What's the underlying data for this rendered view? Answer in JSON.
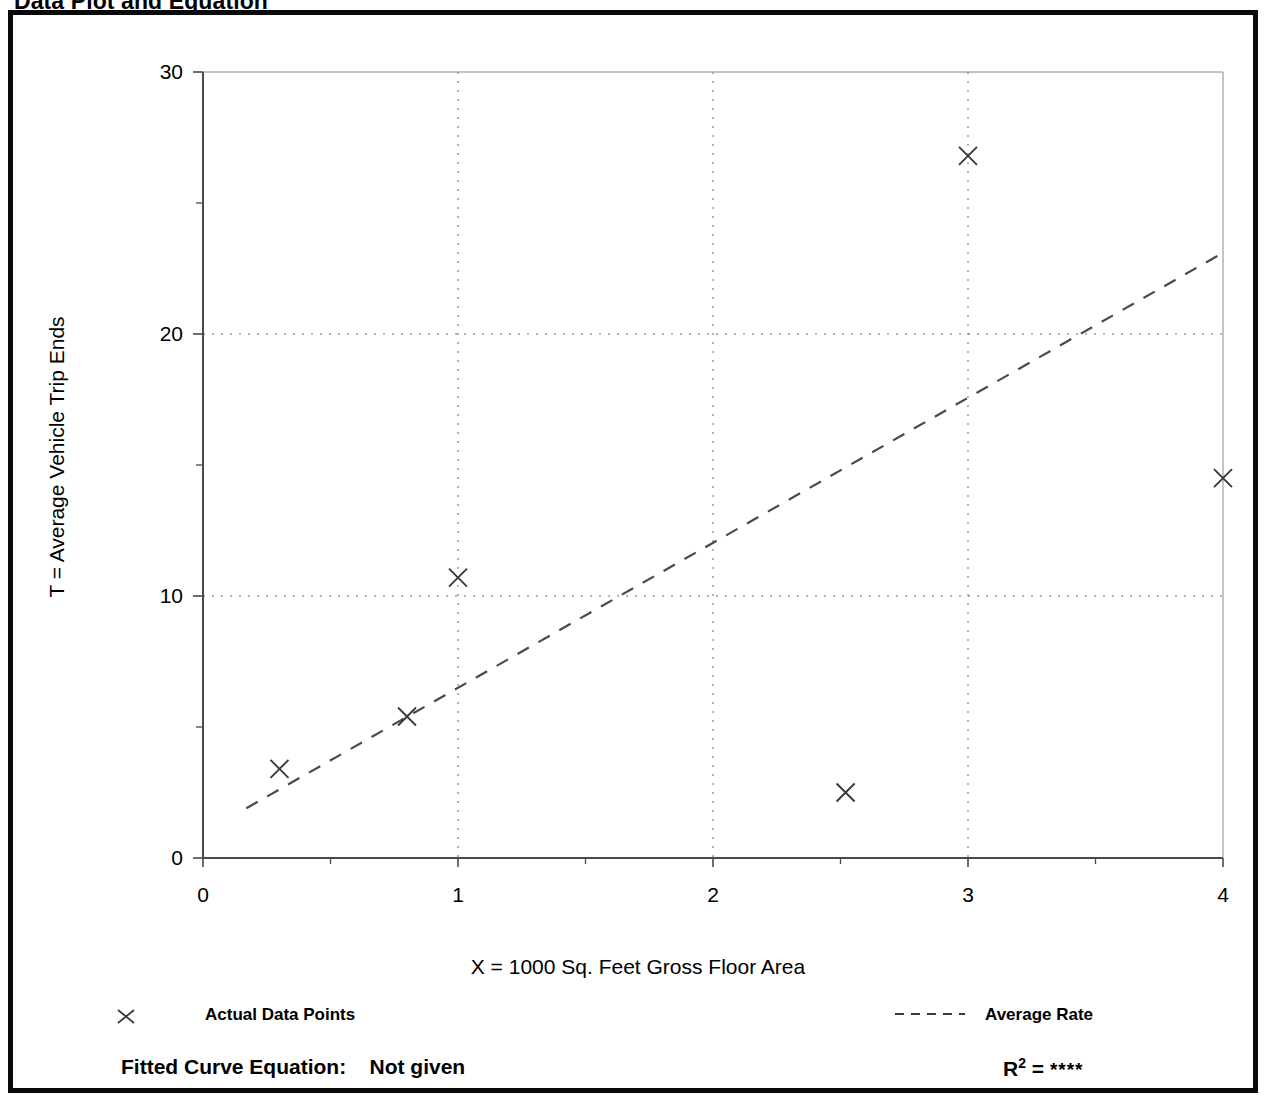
{
  "page": {
    "title": "Data Plot and Equation"
  },
  "chart_data": {
    "type": "scatter",
    "title": "Data Plot and Equation",
    "xlabel": "X = 1000 Sq. Feet Gross Floor Area",
    "ylabel": "T = Average Vehicle Trip Ends",
    "xlim": [
      0,
      4
    ],
    "ylim": [
      0,
      30
    ],
    "xticks": [
      0,
      1,
      2,
      3,
      4
    ],
    "xtick_labels": [
      "0",
      "1",
      "2",
      "3",
      "4"
    ],
    "xminor_ticks": [
      0.5,
      1.5,
      2.5,
      3.5
    ],
    "yticks": [
      0,
      10,
      20,
      30
    ],
    "ytick_labels": [
      "0",
      "10",
      "20",
      "30"
    ],
    "yminor_ticks": [
      5,
      15,
      25
    ],
    "grid": true,
    "gridlines_x": [
      1,
      2,
      3
    ],
    "gridlines_y": [
      10,
      20
    ],
    "legend_position": "below-axes",
    "series": [
      {
        "name": "Actual Data Points",
        "type": "scatter",
        "marker": "x",
        "points": [
          {
            "x": 0.3,
            "y": 3.4
          },
          {
            "x": 0.8,
            "y": 5.4
          },
          {
            "x": 1.0,
            "y": 10.7
          },
          {
            "x": 2.52,
            "y": 2.5
          },
          {
            "x": 3.0,
            "y": 26.8
          },
          {
            "x": 4.0,
            "y": 14.5
          }
        ]
      },
      {
        "name": "Average Rate",
        "type": "line",
        "style": "dashed",
        "points": [
          {
            "x": 0.17,
            "y": 1.9
          },
          {
            "x": 4.0,
            "y": 23.1
          }
        ]
      }
    ]
  },
  "legend": {
    "points_marker": "x-marker-icon",
    "points_label": "Actual Data Points",
    "rate_swatch": "dashed-line-icon",
    "rate_label": "Average Rate"
  },
  "footer": {
    "equation_label": "Fitted Curve Equation:",
    "equation_value": "Not given",
    "r_label": "R",
    "r_exponent": "2",
    "r_equals": "=",
    "r_value": "****"
  },
  "colors": {
    "frame": "#0a0a0a",
    "axis": "#4a4a4a",
    "grid": "#6b6b6b",
    "marker": "#3a3a3a",
    "trend": "#4a4a4a",
    "text": "#000000",
    "background": "#ffffff"
  }
}
